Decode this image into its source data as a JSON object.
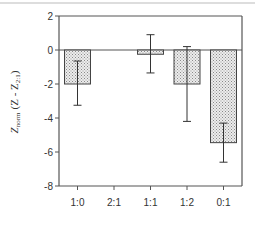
{
  "chart_data": {
    "type": "bar",
    "title": "",
    "xlabel": "",
    "ylabel": "Z_norm (Z - Z_2:1)",
    "ylabel_parts": {
      "main": "Z",
      "main_sub": "norm",
      "paren_open": "(Z - Z",
      "paren_sub": "2:1",
      "paren_close": ")"
    },
    "categories": [
      "1:0",
      "2:1",
      "1:1",
      "1:2",
      "0:1"
    ],
    "values": [
      -2.0,
      0.0,
      -0.25,
      -2.0,
      -5.45
    ],
    "error_bars": [
      {
        "upper": -0.65,
        "lower": -3.25
      },
      null,
      {
        "upper": 0.9,
        "lower": -1.35
      },
      {
        "upper": 0.2,
        "lower": -4.2
      },
      {
        "upper": -4.3,
        "lower": -6.6
      }
    ],
    "ylim": [
      -8,
      2
    ],
    "yticks": [
      2,
      0,
      -2,
      -4,
      -6,
      -8
    ],
    "grid": false,
    "legend": null,
    "bar_fill": "#d8d8d8",
    "bar_pattern": "stippled",
    "axis_color": "#555555"
  }
}
